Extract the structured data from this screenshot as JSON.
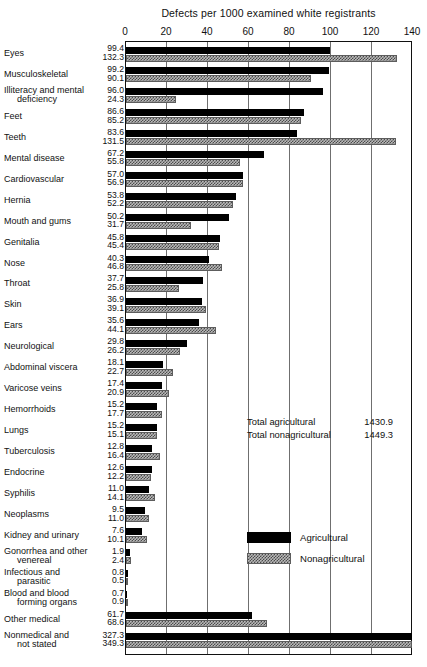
{
  "chart_data": {
    "type": "bar",
    "orientation": "horizontal",
    "title": "Defects per 1000 examined white registrants",
    "xlabel": "",
    "ylabel": "",
    "xlim": [
      0,
      140
    ],
    "xticks": [
      0,
      20,
      40,
      60,
      80,
      100,
      120,
      140
    ],
    "grid": true,
    "legend_position": "inside-right",
    "categories": [
      "Eyes",
      "Musculoskeletal",
      "Illiteracy and mental deficiency",
      "Feet",
      "Teeth",
      "Mental disease",
      "Cardiovascular",
      "Hernia",
      "Mouth and gums",
      "Genitalia",
      "Nose",
      "Throat",
      "Skin",
      "Ears",
      "Neurological",
      "Abdominal viscera",
      "Varicose veins",
      "Hemorrhoids",
      "Lungs",
      "Tuberculosis",
      "Endocrine",
      "Syphilis",
      "Neoplasms",
      "Kidney and urinary",
      "Gonorrhea and other venereal",
      "Infectious and parasitic",
      "Blood and blood forming organs",
      "Other medical",
      "Nonmedical and not stated"
    ],
    "series": [
      {
        "name": "Agricultural",
        "color": "#000000",
        "values": [
          99.4,
          99.2,
          96.0,
          86.6,
          83.6,
          67.2,
          57.0,
          53.8,
          50.2,
          45.8,
          40.3,
          37.7,
          36.9,
          35.6,
          29.8,
          18.1,
          17.4,
          15.2,
          15.2,
          12.8,
          12.6,
          11.0,
          9.5,
          7.6,
          1.9,
          0.8,
          0.7,
          61.7,
          327.3
        ]
      },
      {
        "name": "Nonagricultural",
        "color": "#b9b9b9",
        "values": [
          132.3,
          90.1,
          24.3,
          85.2,
          131.5,
          55.8,
          56.9,
          52.2,
          31.7,
          45.4,
          46.8,
          25.8,
          39.1,
          44.1,
          26.2,
          22.7,
          20.9,
          17.7,
          15.1,
          16.4,
          12.2,
          14.1,
          11.0,
          10.1,
          2.4,
          0.5,
          0.9,
          68.6,
          349.3
        ]
      }
    ],
    "annotations": [
      {
        "label": "Total agricultural",
        "value": "1430.9"
      },
      {
        "label": "Total nonagricultural",
        "value": "1449.3"
      }
    ]
  },
  "rows": [
    {
      "line1": "Eyes",
      "line2": "",
      "agr": "99.4",
      "nonagr": "132.3"
    },
    {
      "line1": "Musculoskeletal",
      "line2": "",
      "agr": "99.2",
      "nonagr": "90.1"
    },
    {
      "line1": "Illiteracy and mental",
      "line2": "deficiency",
      "agr": "96.0",
      "nonagr": "24.3"
    },
    {
      "line1": "Feet",
      "line2": "",
      "agr": "86.6",
      "nonagr": "85.2"
    },
    {
      "line1": "Teeth",
      "line2": "",
      "agr": "83.6",
      "nonagr": "131.5"
    },
    {
      "line1": "Mental disease",
      "line2": "",
      "agr": "67.2",
      "nonagr": "55.8"
    },
    {
      "line1": "Cardiovascular",
      "line2": "",
      "agr": "57.0",
      "nonagr": "56.9"
    },
    {
      "line1": "Hernia",
      "line2": "",
      "agr": "53.8",
      "nonagr": "52.2"
    },
    {
      "line1": "Mouth and gums",
      "line2": "",
      "agr": "50.2",
      "nonagr": "31.7"
    },
    {
      "line1": "Genitalia",
      "line2": "",
      "agr": "45.8",
      "nonagr": "45.4"
    },
    {
      "line1": "Nose",
      "line2": "",
      "agr": "40.3",
      "nonagr": "46.8"
    },
    {
      "line1": "Throat",
      "line2": "",
      "agr": "37.7",
      "nonagr": "25.8"
    },
    {
      "line1": "Skin",
      "line2": "",
      "agr": "36.9",
      "nonagr": "39.1"
    },
    {
      "line1": "Ears",
      "line2": "",
      "agr": "35.6",
      "nonagr": "44.1"
    },
    {
      "line1": "Neurological",
      "line2": "",
      "agr": "29.8",
      "nonagr": "26.2"
    },
    {
      "line1": "Abdominal viscera",
      "line2": "",
      "agr": "18.1",
      "nonagr": "22.7"
    },
    {
      "line1": "Varicose veins",
      "line2": "",
      "agr": "17.4",
      "nonagr": "20.9"
    },
    {
      "line1": "Hemorrhoids",
      "line2": "",
      "agr": "15.2",
      "nonagr": "17.7"
    },
    {
      "line1": "Lungs",
      "line2": "",
      "agr": "15.2",
      "nonagr": "15.1"
    },
    {
      "line1": "Tuberculosis",
      "line2": "",
      "agr": "12.8",
      "nonagr": "16.4"
    },
    {
      "line1": "Endocrine",
      "line2": "",
      "agr": "12.6",
      "nonagr": "12.2"
    },
    {
      "line1": "Syphilis",
      "line2": "",
      "agr": "11.0",
      "nonagr": "14.1"
    },
    {
      "line1": "Neoplasms",
      "line2": "",
      "agr": "9.5",
      "nonagr": "11.0"
    },
    {
      "line1": "Kidney and urinary",
      "line2": "",
      "agr": "7.6",
      "nonagr": "10.1"
    },
    {
      "line1": "Gonorrhea and other",
      "line2": "venereal",
      "agr": "1.9",
      "nonagr": "2.4"
    },
    {
      "line1": "Infectious and",
      "line2": "parasitic",
      "agr": "0.8",
      "nonagr": "0.5"
    },
    {
      "line1": "Blood and blood",
      "line2": "forming organs",
      "agr": "0.7",
      "nonagr": "0.9"
    },
    {
      "line1": "Other medical",
      "line2": "",
      "agr": "61.7",
      "nonagr": "68.6"
    },
    {
      "line1": "Nonmedical  and",
      "line2": "not stated",
      "agr": "327.3",
      "nonagr": "349.3"
    }
  ],
  "axis": {
    "ticks": [
      "0",
      "20",
      "40",
      "60",
      "80",
      "100",
      "120",
      "140"
    ]
  },
  "legend": {
    "items": [
      {
        "label": "Agricultural"
      },
      {
        "label": "Nonagricultural"
      }
    ]
  },
  "totals": {
    "rows": [
      {
        "label": "Total agricultural",
        "value": "1430.9"
      },
      {
        "label": "Total nonagricultural",
        "value": "1449.3"
      }
    ]
  }
}
